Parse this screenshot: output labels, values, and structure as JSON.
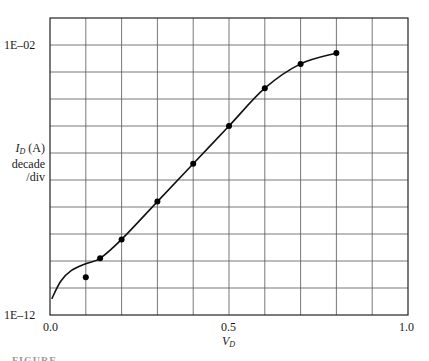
{
  "chart_data": {
    "type": "line",
    "title": "",
    "xlabel": "V_D",
    "ylabel": "I_D (A) decade /div",
    "yscale": "log",
    "xlim": [
      0.0,
      1.0
    ],
    "ylim_log10": [
      -12,
      -1
    ],
    "grid": true,
    "x_ticks": [
      {
        "value": 0.0,
        "label": "0.0"
      },
      {
        "value": 0.5,
        "label": "0.5"
      },
      {
        "value": 1.0,
        "label": "1.0"
      }
    ],
    "y_ticks": [
      {
        "value_log10": -2,
        "label": "1E–02"
      },
      {
        "value_log10": -12,
        "label": "1E–12"
      }
    ],
    "series": [
      {
        "name": "measured points",
        "style": "markers",
        "x": [
          0.1,
          0.14,
          0.2,
          0.3,
          0.4,
          0.5,
          0.6,
          0.7,
          0.8
        ],
        "log10_y": [
          -10.6,
          -9.9,
          -9.2,
          -7.8,
          -6.4,
          -5.0,
          -3.6,
          -2.7,
          -2.3
        ]
      },
      {
        "name": "model curve",
        "style": "line",
        "x": [
          0.005,
          0.03,
          0.06,
          0.1,
          0.14,
          0.2,
          0.3,
          0.4,
          0.5,
          0.6,
          0.7,
          0.8
        ],
        "log10_y": [
          -11.4,
          -10.75,
          -10.35,
          -10.1,
          -9.9,
          -9.2,
          -7.8,
          -6.4,
          -5.0,
          -3.6,
          -2.7,
          -2.3
        ]
      }
    ]
  },
  "labels": {
    "y_top_tick": "1E–02",
    "y_bottom_tick": "1E–12",
    "x_tick_0": "0.0",
    "x_tick_mid": "0.5",
    "x_tick_end": "1.0",
    "y_axis_main": "I",
    "y_axis_sub": "D",
    "y_axis_unit": " (A)",
    "y_axis_line2": "decade",
    "y_axis_line3": "/div",
    "x_axis_main": "V",
    "x_axis_sub": "D",
    "caption": "FIGURE"
  },
  "style": {
    "grid_color": "#555555",
    "frame_color": "#222222",
    "line_color": "#111111",
    "marker_color": "#000000"
  }
}
